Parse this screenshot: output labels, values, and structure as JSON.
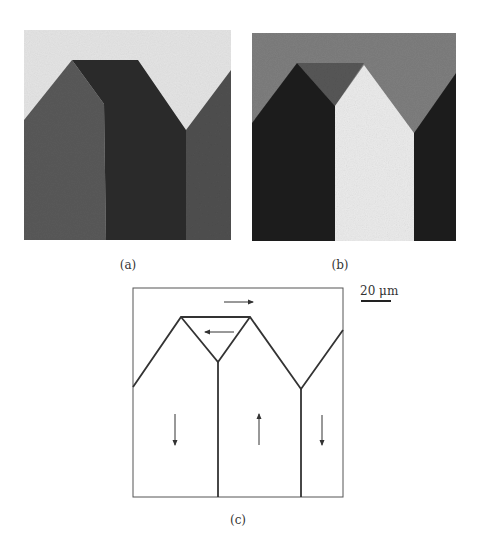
{
  "figure": {
    "panels": [
      {
        "id": "a",
        "label": "(a)",
        "kind": "micrograph"
      },
      {
        "id": "b",
        "label": "(b)",
        "kind": "micrograph"
      },
      {
        "id": "c",
        "label": "(c)",
        "kind": "schematic"
      }
    ],
    "scale_bar": {
      "label": "20 μm"
    },
    "colors": {
      "a_background": "#e6e6e6",
      "a_left_domain": "#5a5a5a",
      "a_center_domain": "#2a2a2a",
      "a_right_domain": "#4e4e4e",
      "b_background": "#7d7d7d",
      "b_dark_domain": "#1e1e1e",
      "b_bright_domain": "#ececec",
      "b_cap": "#555555",
      "line": "#333333"
    }
  }
}
